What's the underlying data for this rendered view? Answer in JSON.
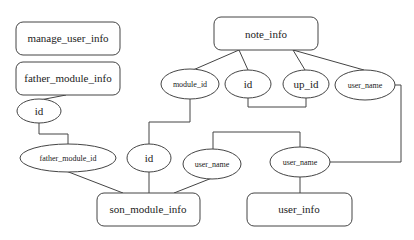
{
  "diagram": {
    "type": "entity-relationship",
    "colors": {
      "stroke": "#444444",
      "fill": "#ffffff",
      "text": "#222222"
    },
    "entities": {
      "manage_user_info": {
        "label": "manage_user_info"
      },
      "father_module_info": {
        "label": "father_module_info"
      },
      "note_info": {
        "label": "note_info"
      },
      "son_module_info": {
        "label": "son_module_info"
      },
      "user_info": {
        "label": "user_info"
      }
    },
    "attributes": {
      "father_id": {
        "label": "id",
        "entity": "father_module_info"
      },
      "note_module_id": {
        "label": "module_id",
        "entity": "note_info"
      },
      "note_id": {
        "label": "id",
        "entity": "note_info"
      },
      "note_up_id": {
        "label": "up_id",
        "entity": "note_info"
      },
      "note_user_name": {
        "label": "user_name",
        "entity": "note_info"
      },
      "son_father_module_id": {
        "label": "father_module_id",
        "entity": "son_module_info"
      },
      "son_id": {
        "label": "id",
        "entity": "son_module_info"
      },
      "son_user_name": {
        "label": "user_name",
        "entity": "son_module_info"
      },
      "user_user_name": {
        "label": "user_name",
        "entity": "user_info"
      }
    },
    "links": [
      {
        "from": "father_id",
        "to": "son_father_module_id"
      },
      {
        "from": "note_module_id",
        "to": "son_id"
      },
      {
        "from": "note_id",
        "to": "note_up_id"
      },
      {
        "from": "note_user_name",
        "to": "user_user_name"
      },
      {
        "from": "son_user_name",
        "to": "user_user_name"
      }
    ]
  }
}
